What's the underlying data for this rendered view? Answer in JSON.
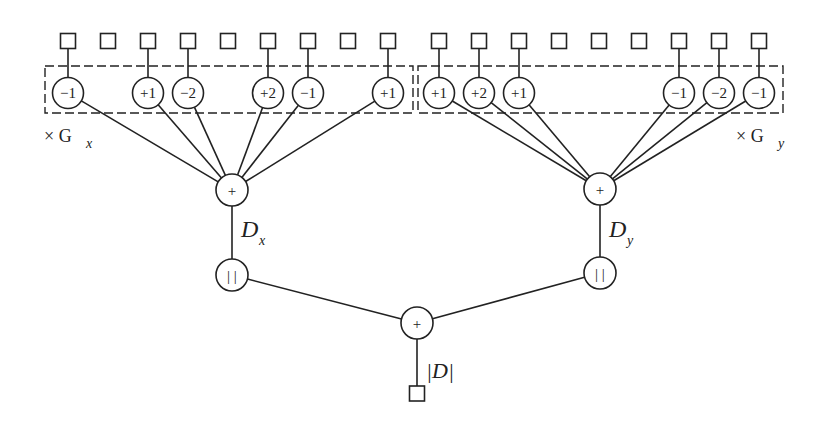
{
  "diagram": {
    "title": "",
    "colors": {
      "stroke": "#222222",
      "background": "#ffffff"
    },
    "left_branch": {
      "kernel_label": "× G",
      "kernel_sub": "x",
      "input_squares": 9,
      "weights": [
        {
          "index": 0,
          "label": "−1"
        },
        {
          "index": 2,
          "label": "+1"
        },
        {
          "index": 3,
          "label": "−2"
        },
        {
          "index": 5,
          "label": "+2"
        },
        {
          "index": 6,
          "label": "−1"
        },
        {
          "index": 8,
          "label": "+1"
        }
      ],
      "sum_node": "+",
      "output_label": "D",
      "output_sub": "x",
      "abs_node": "| |"
    },
    "right_branch": {
      "kernel_label": "× G",
      "kernel_sub": "y",
      "input_squares": 9,
      "weights": [
        {
          "index": 0,
          "label": "+1"
        },
        {
          "index": 1,
          "label": "+2"
        },
        {
          "index": 2,
          "label": "+1"
        },
        {
          "index": 6,
          "label": "−1"
        },
        {
          "index": 7,
          "label": "−2"
        },
        {
          "index": 8,
          "label": "−1"
        }
      ],
      "sum_node": "+",
      "output_label": "D",
      "output_sub": "y",
      "abs_node": "| |"
    },
    "combine": {
      "sum_node": "+",
      "output_label": "|D|"
    }
  }
}
